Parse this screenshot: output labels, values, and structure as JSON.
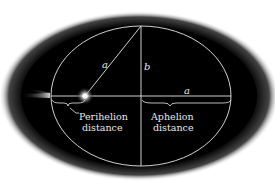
{
  "diagram": {
    "labels": {
      "semi_major_diag": "a",
      "semi_minor": "b",
      "semi_major_axis": "a",
      "perihelion_line1": "Perihelion",
      "perihelion_line2": "distance",
      "aphelion_line1": "Aphelion",
      "aphelion_line2": "distance"
    },
    "colors": {
      "background": "#000000",
      "lines": "#e6e6e6",
      "page": "#ffffff"
    }
  }
}
